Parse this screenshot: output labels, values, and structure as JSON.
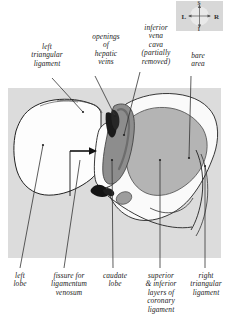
{
  "figure": {
    "compass": {
      "left": "L",
      "right": "R",
      "superior": "S",
      "inferior": "I"
    },
    "labels_top": [
      {
        "id": "lt-lig",
        "text": "left\ntriangular\nligament"
      },
      {
        "id": "open-hv",
        "text": "openings\nof\nhepatic\nveins"
      },
      {
        "id": "ivc",
        "text": "inferior\nvena\ncava\n(partially\nremoved)"
      },
      {
        "id": "bare",
        "text": "bare\narea"
      }
    ],
    "labels_bottom": [
      {
        "id": "left-lobe",
        "text": "left\nlobe"
      },
      {
        "id": "fissure",
        "text": "fissure for\nligamentum\nvenosum"
      },
      {
        "id": "caudate",
        "text": "caudate\nlobe"
      },
      {
        "id": "sup-inf",
        "text": "superior\n& inferior\nlayers of\ncoronary\nligament"
      },
      {
        "id": "rt-lig",
        "text": "right\ntriangular\nligament"
      }
    ],
    "colors": {
      "panel_background": "#dcdcdc",
      "compass_background": "#d8d8d8",
      "liver_light": "#fbfbfb",
      "bare_area": "#b4b4b4",
      "ivc_groove": "#8d8d8d",
      "vein_opening": "#1c1c1c",
      "outline": "#222222",
      "leader_line": "#333333"
    }
  }
}
